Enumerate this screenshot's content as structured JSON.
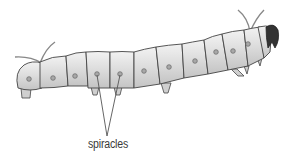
{
  "diagram": {
    "labels": [
      {
        "text": "spiracles",
        "points_to": "spiracle holes on body segments"
      }
    ],
    "colors": {
      "body": "#d8d8d8",
      "body_highlight": "#eeeeee",
      "outline": "#444444",
      "head": "#333333",
      "spiracle": "#9a9a9a",
      "leader_line": "#555555"
    }
  }
}
